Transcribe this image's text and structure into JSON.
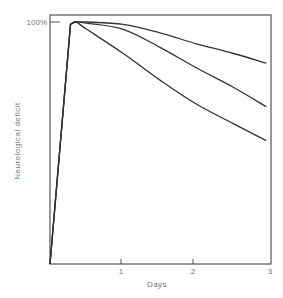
{
  "chart_data": {
    "type": "line",
    "title": "",
    "xlabel": "Days",
    "ylabel": "Neurological deficit",
    "xlim": [
      0,
      3
    ],
    "ylim": [
      0,
      100
    ],
    "x_ticks": [
      1,
      2,
      3
    ],
    "x_tick_labels": [
      "1",
      "2",
      "3"
    ],
    "y_ticks": [
      100
    ],
    "y_tick_labels": [
      "100%"
    ],
    "grid": false,
    "legend": null,
    "series": [
      {
        "name": "curve-upper",
        "x": [
          0,
          0.28,
          0.35,
          0.5,
          1,
          1.5,
          2,
          2.5,
          2.95
        ],
        "y": [
          0,
          99,
          100,
          100,
          99,
          95.5,
          91,
          87,
          83
        ]
      },
      {
        "name": "curve-middle",
        "x": [
          0,
          0.28,
          0.35,
          0.5,
          1,
          1.5,
          2,
          2.5,
          2.95
        ],
        "y": [
          0,
          99,
          100,
          99.5,
          97,
          89.5,
          81,
          73,
          65
        ]
      },
      {
        "name": "curve-lower",
        "x": [
          0,
          0.28,
          0.35,
          0.5,
          1,
          1.5,
          2,
          2.5,
          2.95
        ],
        "y": [
          0,
          99,
          100,
          97,
          87,
          76,
          66,
          58,
          51
        ]
      }
    ]
  },
  "labels": {
    "y_axis": "Neurological deficit",
    "x_axis": "Days",
    "y_tick_100": "100%",
    "x_tick_1": "1",
    "x_tick_2": "2",
    "x_tick_3": "3"
  },
  "colors": {
    "line": "#333333",
    "frame": "#555555",
    "text": "#777777"
  }
}
